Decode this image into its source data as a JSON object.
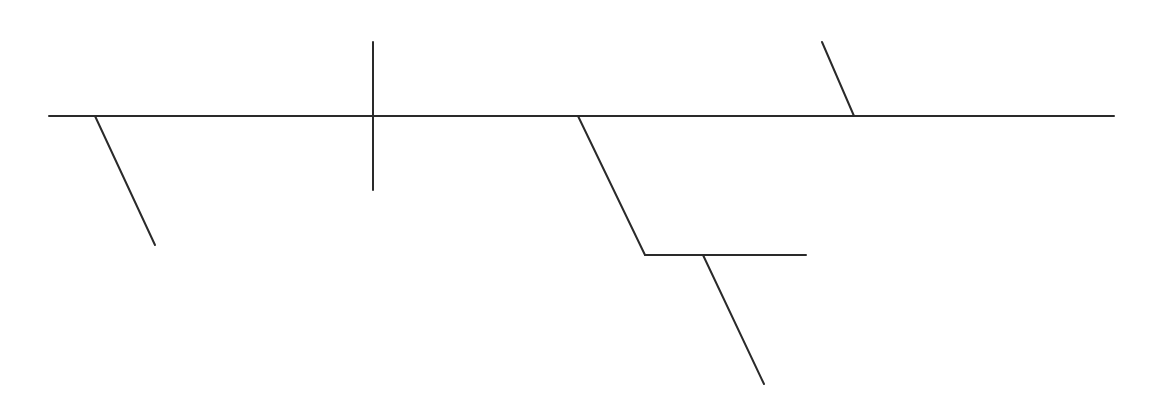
{
  "diagram": {
    "type": "sentence-diagram",
    "stroke_color": "#2a2a2a",
    "background": "#ffffff",
    "stroke_width": 2,
    "segments": [
      {
        "name": "baseline",
        "x1": 49,
        "y1": 116,
        "x2": 1114,
        "y2": 116
      },
      {
        "name": "modifier-line-left",
        "x1": 95,
        "y1": 116,
        "x2": 155,
        "y2": 245
      },
      {
        "name": "subject-predicate-divider",
        "x1": 373,
        "y1": 42,
        "x2": 373,
        "y2": 190
      },
      {
        "name": "prepositional-slant",
        "x1": 578,
        "y1": 116,
        "x2": 645,
        "y2": 255
      },
      {
        "name": "prepositional-object-line",
        "x1": 645,
        "y1": 255,
        "x2": 806,
        "y2": 255
      },
      {
        "name": "object-modifier-line",
        "x1": 703,
        "y1": 255,
        "x2": 764,
        "y2": 384
      },
      {
        "name": "complement-slant",
        "x1": 822,
        "y1": 42,
        "x2": 854,
        "y2": 116
      }
    ]
  }
}
